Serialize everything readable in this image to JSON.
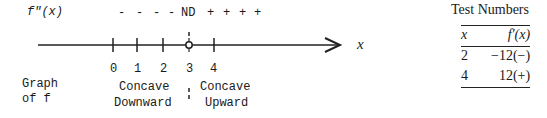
{
  "sign_chart": {
    "row_label": "f″(x)",
    "signs": [
      "-",
      "-",
      "-",
      "-",
      "ND",
      "+",
      "+",
      "+",
      "+"
    ],
    "axis_label": "x",
    "ticks": [
      "0",
      "1",
      "2",
      "3",
      "4"
    ],
    "graph_label_line1": "Graph",
    "graph_label_line2": "of f",
    "left_interval_line1": "Concave",
    "left_interval_line2": "Downward",
    "right_interval_line1": "Concave",
    "right_interval_line2": "Upward"
  },
  "test_numbers": {
    "title": "Test Numbers",
    "headers": [
      "x",
      "f′(x)"
    ],
    "rows": [
      [
        "2",
        "−12(−)"
      ],
      [
        "4",
        "12(+)"
      ]
    ]
  }
}
